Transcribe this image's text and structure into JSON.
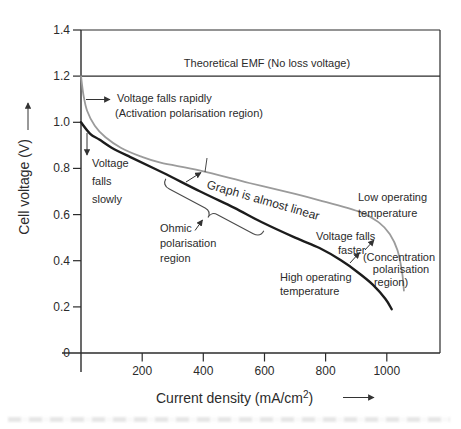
{
  "chart_data": {
    "type": "line",
    "title": "",
    "xlabel": "Current density (mA/cm²)",
    "xlabel_parts": {
      "pre": "Current density (mA/cm",
      "sup": "2",
      "post": ")"
    },
    "ylabel": "Cell voltage (V)",
    "xlim": [
      0,
      1174
    ],
    "ylim": [
      0,
      1.4
    ],
    "grid": false,
    "xticks": {
      "values": [
        200,
        400,
        600,
        800,
        1000
      ],
      "labels": [
        "200",
        "400",
        "600",
        "800",
        "1000"
      ]
    },
    "yticks": {
      "values": [
        0,
        0.2,
        0.4,
        0.6,
        0.8,
        1.0,
        1.2,
        1.4
      ],
      "labels": [
        "0",
        "0.2",
        "0.4",
        "0.6",
        "0.8",
        "1.0",
        "1.2",
        "1.4"
      ]
    },
    "reference_line": {
      "y": 1.2,
      "label": "Theoretical EMF (No loss voltage)"
    },
    "series": [
      {
        "name": "Low operating temperature",
        "color": "#9b9b9b",
        "stroke_width": 1.8,
        "points": [
          [
            0,
            1.2
          ],
          [
            8,
            1.12
          ],
          [
            20,
            1.05
          ],
          [
            45,
            0.985
          ],
          [
            80,
            0.935
          ],
          [
            130,
            0.89
          ],
          [
            195,
            0.852
          ],
          [
            260,
            0.825
          ],
          [
            390,
            0.79
          ],
          [
            550,
            0.737
          ],
          [
            700,
            0.69
          ],
          [
            780,
            0.662
          ],
          [
            915,
            0.61
          ],
          [
            975,
            0.565
          ],
          [
            1010,
            0.515
          ],
          [
            1035,
            0.445
          ],
          [
            1050,
            0.35
          ],
          [
            1056,
            0.27
          ]
        ]
      },
      {
        "name": "High operating temperature",
        "color": "#1c1c1c",
        "stroke_width": 2.4,
        "points": [
          [
            0,
            1.0
          ],
          [
            30,
            0.95
          ],
          [
            60,
            0.925
          ],
          [
            100,
            0.89
          ],
          [
            160,
            0.85
          ],
          [
            270,
            0.78
          ],
          [
            390,
            0.7
          ],
          [
            500,
            0.63
          ],
          [
            590,
            0.568
          ],
          [
            700,
            0.5
          ],
          [
            780,
            0.455
          ],
          [
            850,
            0.402
          ],
          [
            905,
            0.35
          ],
          [
            955,
            0.295
          ],
          [
            995,
            0.235
          ],
          [
            1016,
            0.19
          ]
        ]
      }
    ],
    "annotations": {
      "emf": "Theoretical EMF (No loss voltage)",
      "rapid_1": "Voltage falls rapidly",
      "rapid_2": "(Activation polarisation region)",
      "slow_1": "Voltage",
      "slow_2": "falls",
      "slow_3": "slowly",
      "linear": "Graph is almost linear",
      "ohmic_1": "Ohmic",
      "ohmic_2": "polarisation",
      "ohmic_3": "region",
      "low_1": "Low operating",
      "low_2": "temperature",
      "faster_1": "Voltage falls",
      "faster_2": "faster",
      "conc_1": "(Concentration",
      "conc_2": "polarisation",
      "conc_3": "region)",
      "high_1": "High operating",
      "high_2": "temperature"
    }
  }
}
